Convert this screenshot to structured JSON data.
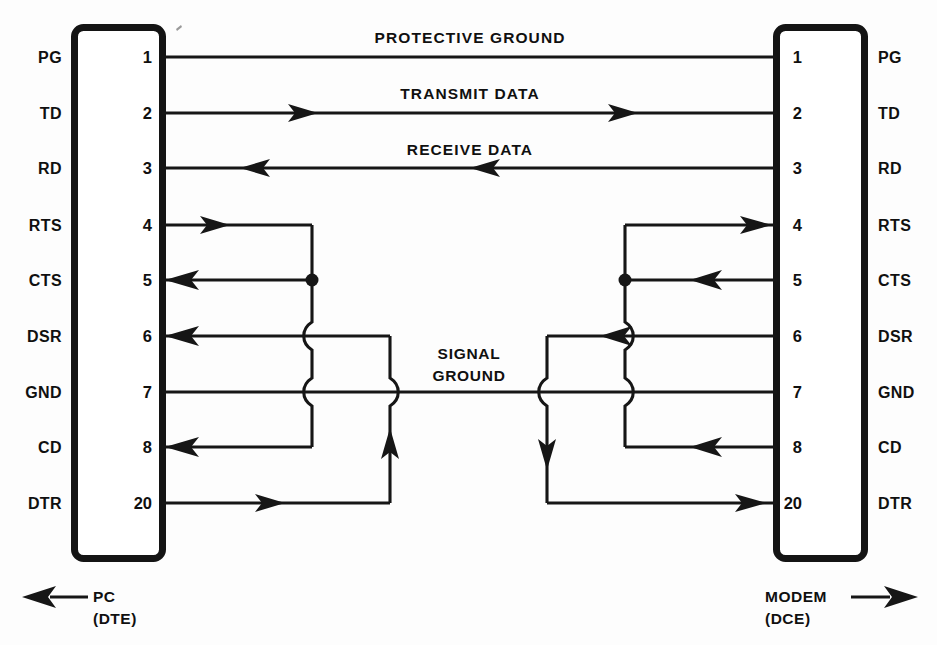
{
  "diagram": {
    "ink_color": "#161616",
    "background_color": "#fdfdfd"
  },
  "left_connector": {
    "name": "PC",
    "type": "(DTE)",
    "direction_icon": "left-arrow-icon"
  },
  "right_connector": {
    "name": "MODEM",
    "type": "(DCE)",
    "direction_icon": "right-arrow-icon"
  },
  "pins": [
    {
      "number": "1",
      "signal": "PG",
      "row_y": 57
    },
    {
      "number": "2",
      "signal": "TD",
      "row_y": 113
    },
    {
      "number": "3",
      "signal": "RD",
      "row_y": 168
    },
    {
      "number": "4",
      "signal": "RTS",
      "row_y": 225
    },
    {
      "number": "5",
      "signal": "CTS",
      "row_y": 280
    },
    {
      "number": "6",
      "signal": "DSR",
      "row_y": 336
    },
    {
      "number": "7",
      "signal": "GND",
      "row_y": 392
    },
    {
      "number": "8",
      "signal": "CD",
      "row_y": 447
    },
    {
      "number": "20",
      "signal": "DTR",
      "row_y": 503
    }
  ],
  "wire_labels": {
    "protective_ground": "PROTECTIVE GROUND",
    "transmit_data": "TRANSMIT DATA",
    "receive_data": "RECEIVE DATA",
    "signal_ground_line1": "SIGNAL",
    "signal_ground_line2": "GROUND"
  },
  "pin_numbers": {
    "p1": "1",
    "p2": "2",
    "p3": "3",
    "p4": "4",
    "p5": "5",
    "p6": "6",
    "p7": "7",
    "p8": "8",
    "p20": "20"
  },
  "signal_names": {
    "s1": "PG",
    "s2": "TD",
    "s3": "RD",
    "s4": "RTS",
    "s5": "CTS",
    "s6": "DSR",
    "s7": "GND",
    "s8": "CD",
    "s20": "DTR"
  }
}
